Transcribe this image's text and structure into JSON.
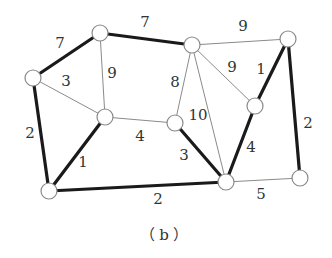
{
  "caption": "（b）",
  "colors": {
    "thin_edge": "#8a8a8a",
    "thick_edge": "#1a1a1a",
    "node_fill": "#ffffff",
    "node_stroke": "#8a8a8a",
    "text": "#333333"
  },
  "nodes": [
    {
      "id": "A",
      "x": 33,
      "y": 78
    },
    {
      "id": "B",
      "x": 100,
      "y": 33
    },
    {
      "id": "C",
      "x": 192,
      "y": 45
    },
    {
      "id": "D",
      "x": 288,
      "y": 39
    },
    {
      "id": "E",
      "x": 105,
      "y": 117
    },
    {
      "id": "F",
      "x": 175,
      "y": 123
    },
    {
      "id": "G",
      "x": 255,
      "y": 106
    },
    {
      "id": "H",
      "x": 49,
      "y": 191
    },
    {
      "id": "I",
      "x": 226,
      "y": 182
    },
    {
      "id": "J",
      "x": 300,
      "y": 178
    }
  ],
  "edges": [
    {
      "from": "A",
      "to": "B",
      "weight": "7",
      "thick": true,
      "lx": 60,
      "ly": 43
    },
    {
      "from": "B",
      "to": "C",
      "weight": "7",
      "thick": true,
      "lx": 145,
      "ly": 22
    },
    {
      "from": "C",
      "to": "D",
      "weight": "9",
      "thick": false,
      "lx": 243,
      "ly": 26
    },
    {
      "from": "A",
      "to": "E",
      "weight": "3",
      "thick": false,
      "lx": 66,
      "ly": 81
    },
    {
      "from": "B",
      "to": "E",
      "weight": "9",
      "thick": false,
      "lx": 112,
      "ly": 73
    },
    {
      "from": "A",
      "to": "H",
      "weight": "2",
      "thick": true,
      "lx": 30,
      "ly": 133
    },
    {
      "from": "E",
      "to": "H",
      "weight": "1",
      "thick": true,
      "lx": 83,
      "ly": 162
    },
    {
      "from": "E",
      "to": "F",
      "weight": "4",
      "thick": false,
      "lx": 140,
      "ly": 136
    },
    {
      "from": "C",
      "to": "F",
      "weight": "8",
      "thick": false,
      "lx": 175,
      "ly": 82
    },
    {
      "from": "C",
      "to": "I",
      "weight": "10",
      "thick": false,
      "lx": 198,
      "ly": 115
    },
    {
      "from": "C",
      "to": "G",
      "weight": "9",
      "thick": false,
      "lx": 232,
      "ly": 67
    },
    {
      "from": "D",
      "to": "G",
      "weight": "1",
      "thick": true,
      "lx": 261,
      "ly": 69
    },
    {
      "from": "D",
      "to": "J",
      "weight": "2",
      "thick": true,
      "lx": 308,
      "ly": 123
    },
    {
      "from": "F",
      "to": "I",
      "weight": "3",
      "thick": true,
      "lx": 184,
      "ly": 155
    },
    {
      "from": "G",
      "to": "I",
      "weight": "4",
      "thick": true,
      "lx": 251,
      "ly": 147
    },
    {
      "from": "H",
      "to": "I",
      "weight": "2",
      "thick": true,
      "lx": 158,
      "ly": 199
    },
    {
      "from": "I",
      "to": "J",
      "weight": "5",
      "thick": false,
      "lx": 261,
      "ly": 194
    }
  ]
}
